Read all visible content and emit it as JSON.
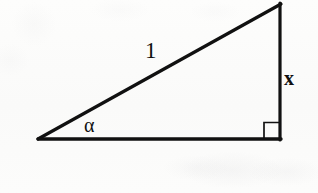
{
  "figure": {
    "type": "right-triangle-diagram",
    "background_color": "#fbfbfa",
    "stroke_color": "#111111",
    "stroke_width": 3,
    "geometry": {
      "vertices": {
        "left_vertex": {
          "x": 38,
          "y": 139
        },
        "apex_vertex": {
          "x": 281,
          "y": 4
        },
        "right_angle_vertex": {
          "x": 281,
          "y": 139
        }
      },
      "sides": [
        {
          "name": "hypotenuse",
          "from": "left_vertex",
          "to": "apex_vertex",
          "label": "1"
        },
        {
          "name": "opposite-leg",
          "from": "apex_vertex",
          "to": "right_angle_vertex",
          "label": "x"
        },
        {
          "name": "adjacent-leg",
          "from": "right_angle_vertex",
          "to": "left_vertex",
          "label": ""
        }
      ],
      "right_angle_marker": {
        "x": 264,
        "y": 122,
        "size": 16,
        "stroke_width": 1.6
      }
    },
    "labels": {
      "hypotenuse": "1",
      "opposite": "x",
      "angle": "α"
    }
  }
}
